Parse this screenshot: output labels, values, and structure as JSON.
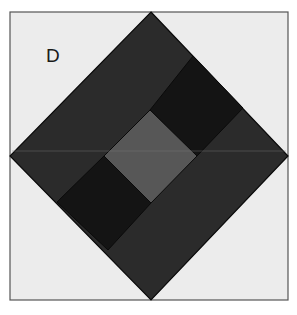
{
  "figure": {
    "panel_label": "D",
    "colors": {
      "background": "#ffffff",
      "frame_fill": "#ececec",
      "frame_stroke": "#555555",
      "outer_diamond": "#2b2b2b",
      "black_squares": "#141414",
      "center_square": "#575757",
      "edge_stroke": "#0a0a0a",
      "midline": "#7a7a7a"
    },
    "shapes": [
      {
        "name": "outer-frame",
        "type": "square"
      },
      {
        "name": "outer-diamond",
        "type": "diamond"
      },
      {
        "name": "upper-right-black-square",
        "type": "diamond"
      },
      {
        "name": "lower-left-black-square",
        "type": "diamond"
      },
      {
        "name": "center-gray-square",
        "type": "diamond"
      }
    ]
  }
}
